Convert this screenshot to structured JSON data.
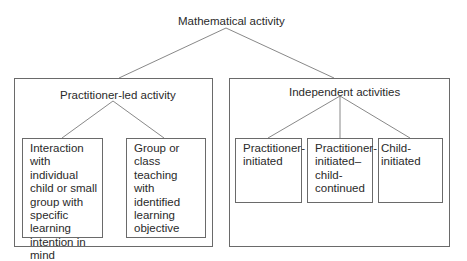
{
  "diagram": {
    "root": {
      "label": "Mathematical activity"
    },
    "groups": [
      {
        "label": "Practitioner-led activity",
        "children": [
          {
            "label": "Interaction with individual child or small group with specific learning intention in mind"
          },
          {
            "label": "Group or class teaching with identified learning objective"
          }
        ]
      },
      {
        "label": "Independent activities",
        "children": [
          {
            "label": "Practitioner-initiated"
          },
          {
            "label": "Practitioner-initiated–child-continued"
          },
          {
            "label": "Child-initiated"
          }
        ]
      }
    ],
    "colors": {
      "line": "#6a6a6a",
      "text": "#2a2a2a",
      "background": "#ffffff"
    }
  }
}
